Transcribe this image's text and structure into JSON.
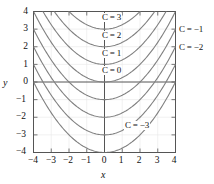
{
  "figure": {
    "title": "",
    "background_color": "#ffffff",
    "curve_color": "#808080",
    "axis_color": "#555555",
    "grid_color": "#e8e8e8",
    "text_color": "#111111"
  },
  "axes": {
    "x_label": "x",
    "y_label": "y",
    "x_ticks": [
      "−4",
      "−3",
      "−2",
      "−1",
      "0",
      "1",
      "2",
      "3",
      "4"
    ],
    "y_ticks": [
      "4",
      "3",
      "2",
      "1",
      "0",
      "−1",
      "−2",
      "−3",
      "−4"
    ]
  },
  "curve_labels": {
    "inside": [
      {
        "text": "C = 3",
        "c": 3
      },
      {
        "text": "C = 2",
        "c": 2
      },
      {
        "text": "C = 1",
        "c": 1
      },
      {
        "text": "C = 0",
        "c": 0
      },
      {
        "text": "C = −3",
        "c": -3
      }
    ],
    "right": [
      {
        "text": "C = −1",
        "c": -1
      },
      {
        "text": "C = −2",
        "c": -2
      }
    ]
  },
  "chart_data": {
    "type": "line",
    "title": "",
    "xlabel": "x",
    "ylabel": "y",
    "xlim": [
      -4,
      4
    ],
    "ylim": [
      -4,
      4
    ],
    "xticks": [
      -4,
      -3,
      -2,
      -1,
      0,
      1,
      2,
      3,
      4
    ],
    "yticks": [
      -4,
      -3,
      -2,
      -1,
      0,
      1,
      2,
      3,
      4
    ],
    "grid": true,
    "legend": "inline-curve-labels",
    "family_formula": "y = x^2/4 + C",
    "series": [
      {
        "name": "C = 3",
        "c": 3,
        "vertex": [
          0,
          3
        ],
        "endpoints": [
          [
            -4,
            4
          ],
          [
            4,
            4
          ]
        ]
      },
      {
        "name": "C = 2",
        "c": 2,
        "vertex": [
          0,
          2
        ],
        "endpoints": [
          [
            -4,
            3
          ],
          [
            4,
            3
          ]
        ]
      },
      {
        "name": "C = 1",
        "c": 1,
        "vertex": [
          0,
          1
        ],
        "endpoints": [
          [
            -4,
            2
          ],
          [
            4,
            2
          ]
        ]
      },
      {
        "name": "C = 0",
        "c": 0,
        "vertex": [
          0,
          0
        ],
        "endpoints": [
          [
            -4,
            1
          ],
          [
            4,
            1
          ]
        ]
      },
      {
        "name": "C = -1",
        "c": -1,
        "vertex": [
          0,
          -1
        ],
        "endpoints": [
          [
            -4,
            0
          ],
          [
            4,
            0
          ]
        ]
      },
      {
        "name": "C = -2",
        "c": -2,
        "vertex": [
          0,
          -2
        ],
        "endpoints": [
          [
            -4,
            -1
          ],
          [
            4,
            -1
          ]
        ]
      },
      {
        "name": "C = -3",
        "c": -3,
        "vertex": [
          0,
          -3
        ],
        "endpoints": [
          [
            -4,
            -2
          ],
          [
            4,
            -2
          ]
        ]
      },
      {
        "name": "C = -4",
        "c": -4,
        "vertex": [
          0,
          -4
        ],
        "endpoints": [
          [
            -4,
            -3
          ],
          [
            4,
            -3
          ]
        ]
      }
    ]
  }
}
